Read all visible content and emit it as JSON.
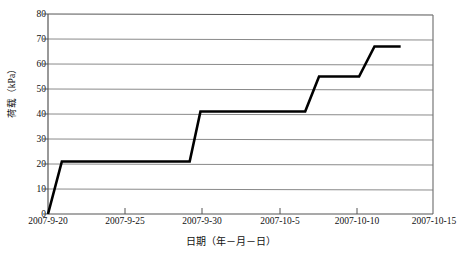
{
  "chart_data": {
    "type": "line",
    "title": "",
    "subtitle": "",
    "xlabel": "日期（年－月－日）",
    "ylabel": "荷载（kPa）",
    "grid": true,
    "legend": "none",
    "xtype": "date",
    "xlim": [
      "2007-9-20",
      "2007-10-15"
    ],
    "xticklabels": [
      "2007-9-20",
      "2007-9-25",
      "2007-9-30",
      "2007-10-5",
      "2007-10-10",
      "2007-10-15"
    ],
    "xtickvalues": [
      0,
      5,
      10,
      15,
      20,
      25
    ],
    "ylim": [
      0,
      80
    ],
    "ytickvalues": [
      0,
      10,
      20,
      30,
      40,
      50,
      60,
      70,
      80
    ],
    "yticklabels": [
      "0",
      "10",
      "20",
      "30",
      "40",
      "50",
      "60",
      "70",
      "80"
    ],
    "series": [
      {
        "name": "荷载",
        "color": "#000000",
        "linewidth": 2.6,
        "step_plateaus": [
          {
            "value": 21,
            "x_start": 0.9,
            "x_end": 9.2
          },
          {
            "value": 41,
            "x_start": 9.9,
            "x_end": 16.7
          },
          {
            "value": 55,
            "x_start": 17.6,
            "x_end": 20.2
          },
          {
            "value": 67,
            "x_start": 21.2,
            "x_end": 22.9
          }
        ],
        "x": [
          0.0,
          0.9,
          9.2,
          9.9,
          16.7,
          17.6,
          20.2,
          21.2,
          22.9
        ],
        "y": [
          0,
          21,
          21,
          41,
          41,
          55,
          55,
          67,
          67
        ]
      }
    ]
  },
  "colors": {
    "line": "#000000",
    "grid": "#8a8a8a",
    "axis": "#4d4d4d",
    "background": "#ffffff",
    "text": "#111111"
  }
}
